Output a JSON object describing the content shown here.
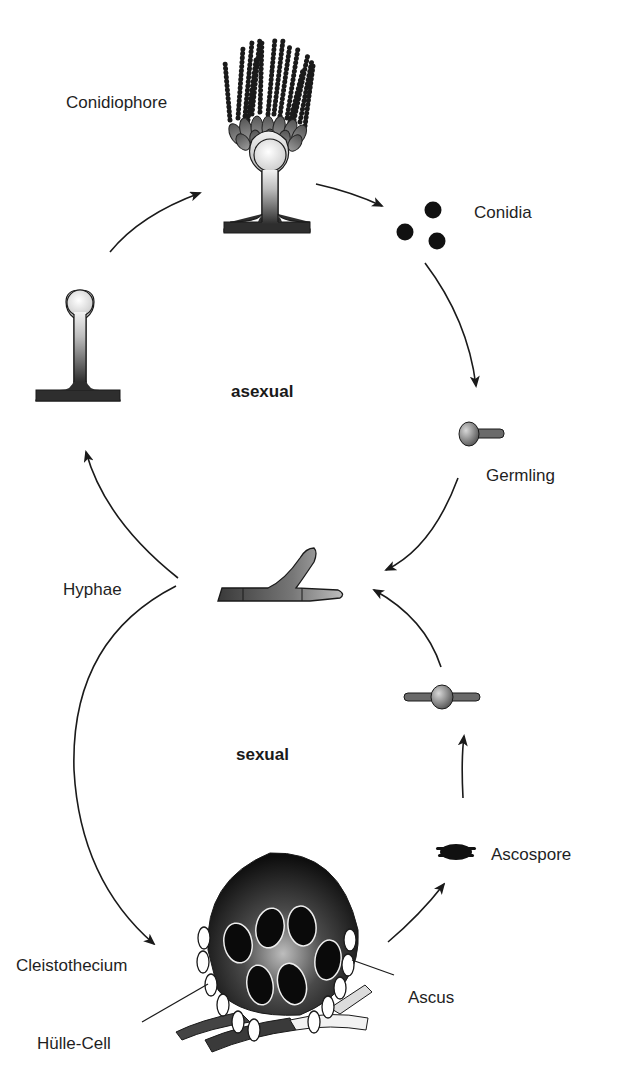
{
  "diagram": {
    "type": "life-cycle",
    "phases": {
      "asexual": "asexual",
      "sexual": "sexual"
    },
    "labels": {
      "conidiophore": "Conidiophore",
      "conidia": "Conidia",
      "germling": "Germling",
      "hyphae": "Hyphae",
      "ascospore": "Ascospore",
      "cleistothecium": "Cleistothecium",
      "ascus": "Ascus",
      "hulle_cell": "Hülle-Cell"
    },
    "flow": [
      {
        "from": "Hyphae",
        "to": "Conidiophore stalk",
        "cycle": "asexual"
      },
      {
        "from": "Conidiophore stalk",
        "to": "Conidiophore",
        "cycle": "asexual"
      },
      {
        "from": "Conidiophore",
        "to": "Conidia",
        "cycle": "asexual"
      },
      {
        "from": "Conidia",
        "to": "Germling",
        "cycle": "asexual"
      },
      {
        "from": "Germling",
        "to": "Hyphae",
        "cycle": "asexual"
      },
      {
        "from": "Hyphae",
        "to": "Cleistothecium",
        "cycle": "sexual"
      },
      {
        "from": "Cleistothecium",
        "to": "Ascospore",
        "cycle": "sexual"
      },
      {
        "from": "Ascospore",
        "to": "Germinating ascospore",
        "cycle": "sexual"
      },
      {
        "from": "Germinating ascospore",
        "to": "Hyphae",
        "cycle": "sexual"
      }
    ],
    "colors": {
      "arrow": "#1a1a1a",
      "text": "#1f1f1f",
      "dark_fill": "#2a2a2a",
      "mid_fill": "#7a7a7a",
      "light_fill": "#e8e8e8"
    }
  }
}
